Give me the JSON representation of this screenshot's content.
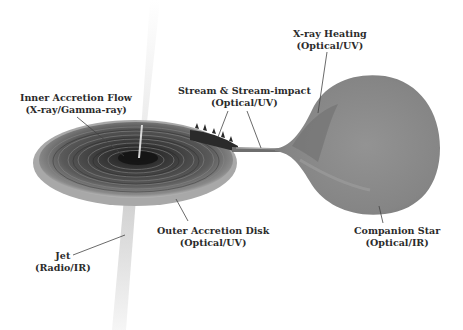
{
  "diagram": {
    "components": [
      {
        "id": "inner_flow",
        "name": "Inner Accretion Flow",
        "band": "(X-ray/Gamma-ray)"
      },
      {
        "id": "stream",
        "name": "Stream & Stream-impact",
        "band": "(Optical/UV)"
      },
      {
        "id": "xray_heating",
        "name": "X-ray Heating",
        "band": "(Optical/UV)"
      },
      {
        "id": "outer_disk",
        "name": "Outer Accretion Disk",
        "band": "(Optical/UV)"
      },
      {
        "id": "companion",
        "name": "Companion Star",
        "band": "(Optical/IR)"
      },
      {
        "id": "jet",
        "name": "Jet",
        "band": "(Radio/IR)"
      }
    ],
    "colors": {
      "background": "#ffffff",
      "disk_dark": "#2a2a2a",
      "disk_light": "#9a9a9a",
      "star": "#8e8e8e",
      "jet": "#d6d6d6",
      "text": "#2b2b2b",
      "leader_line": "#444444"
    }
  }
}
